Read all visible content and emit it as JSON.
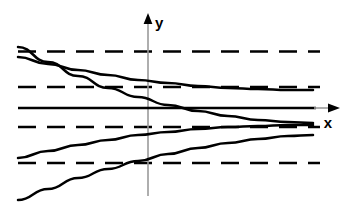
{
  "figure": {
    "background_color": "#ffffff",
    "ink_color": "#000000",
    "axis_color": "#808080",
    "width": 348,
    "height": 213
  },
  "axes": {
    "x_label": "x",
    "y_label": "y",
    "x_axis": {
      "y_px": 108,
      "x_start_px": 18,
      "x_end_px": 338,
      "arrow": "right"
    },
    "y_axis": {
      "x_px": 148,
      "y_start_px": 196,
      "y_end_px": 15,
      "arrow": "up"
    },
    "origin_px": {
      "x": 148,
      "y": 108
    }
  },
  "chart_data": {
    "type": "line",
    "xlabel": "x",
    "ylabel": "y",
    "grid": false,
    "legend": "none",
    "xlim": [
      -130,
      190
    ],
    "ylim": [
      -88,
      93
    ],
    "asymptotes": [
      {
        "name": "asymptote-upper-outer",
        "y": 56,
        "style": "dashed",
        "x_from": -130,
        "x_to": 172
      },
      {
        "name": "asymptote-upper-inner",
        "y": 21,
        "style": "dashed",
        "x_from": -130,
        "x_to": 172
      },
      {
        "name": "asymptote-lower-inner",
        "y": -19,
        "style": "dashed",
        "x_from": -130,
        "x_to": 172
      },
      {
        "name": "asymptote-lower-outer",
        "y": -55,
        "style": "dashed",
        "x_from": -130,
        "x_to": 172
      }
    ],
    "series": [
      {
        "name": "curve-1-upper-outer",
        "style": "solid",
        "points_px": [
          [
            18,
            47
          ],
          [
            48,
            62
          ],
          [
            78,
            76
          ],
          [
            108,
            88
          ],
          [
            138,
            97
          ],
          [
            168,
            105
          ],
          [
            198,
            111
          ],
          [
            228,
            116
          ],
          [
            258,
            120
          ],
          [
            288,
            122
          ],
          [
            313,
            123
          ]
        ]
      },
      {
        "name": "curve-2-upper-inner",
        "style": "solid",
        "points_px": [
          [
            18,
            57
          ],
          [
            48,
            64
          ],
          [
            78,
            70
          ],
          [
            108,
            75
          ],
          [
            138,
            80
          ],
          [
            168,
            83
          ],
          [
            198,
            86
          ],
          [
            228,
            88
          ],
          [
            258,
            89
          ],
          [
            288,
            90
          ],
          [
            313,
            90
          ]
        ]
      },
      {
        "name": "curve-3-lower-inner",
        "style": "solid",
        "points_px": [
          [
            18,
            158
          ],
          [
            48,
            151
          ],
          [
            78,
            145
          ],
          [
            108,
            140
          ],
          [
            138,
            135
          ],
          [
            168,
            132
          ],
          [
            198,
            129
          ],
          [
            228,
            127
          ],
          [
            258,
            126
          ],
          [
            288,
            125
          ],
          [
            313,
            125
          ]
        ]
      },
      {
        "name": "curve-4-lower-outer",
        "style": "solid",
        "points_px": [
          [
            18,
            200
          ],
          [
            48,
            189
          ],
          [
            78,
            178
          ],
          [
            108,
            169
          ],
          [
            138,
            161
          ],
          [
            168,
            154
          ],
          [
            198,
            148
          ],
          [
            228,
            143
          ],
          [
            258,
            139
          ],
          [
            288,
            136
          ],
          [
            313,
            135
          ]
        ]
      }
    ]
  },
  "annotations": {
    "y_axis_label_text": "y",
    "x_axis_label_text": "x"
  }
}
